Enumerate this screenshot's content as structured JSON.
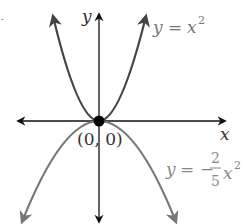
{
  "figure": {
    "stray_mark": ".",
    "axes": {
      "x_label": "x",
      "y_label": "y",
      "color": "#111111"
    },
    "origin_point": {
      "label": "(0, 0)",
      "color": "#000000"
    },
    "curves": [
      {
        "name": "upper-parabola",
        "equation_lhs": "y",
        "equation_eq": "=",
        "equation_rhs_base": "x",
        "equation_rhs_exp": "2",
        "label": "y = x^2",
        "color": "#444444",
        "label_color": "#777777"
      },
      {
        "name": "lower-parabola",
        "equation_lhs": "y",
        "equation_eq": "= −",
        "frac_num": "2",
        "frac_den": "5",
        "equation_rhs_base": "x",
        "equation_rhs_exp": "2",
        "label": "y = -2/5 x^2",
        "color": "#777777",
        "label_color": "#888888"
      }
    ]
  }
}
